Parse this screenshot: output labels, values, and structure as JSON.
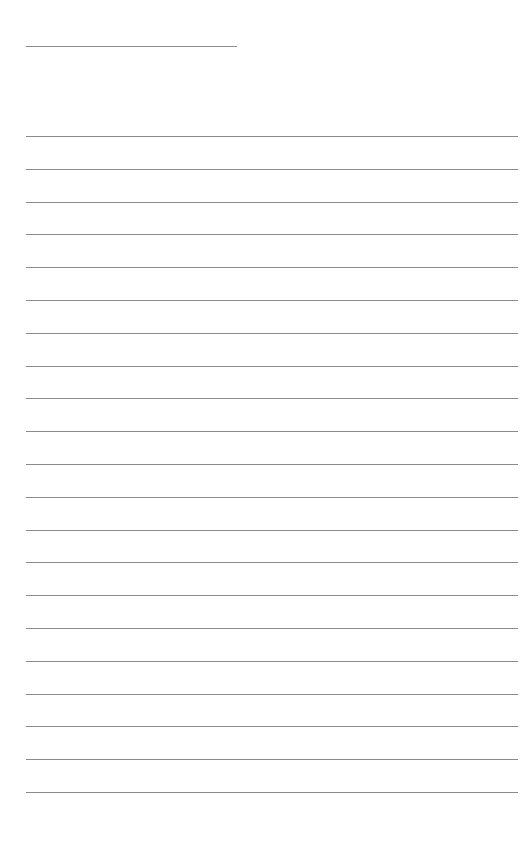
{
  "page": {
    "type": "blank-lined-sheet",
    "header_line": {
      "top": 46,
      "width": 211
    },
    "ruled_lines": {
      "count": 21,
      "first_top": 136,
      "spacing": 32.8,
      "width": 492
    },
    "line_color": "#8a8a8a",
    "background": "#ffffff"
  }
}
